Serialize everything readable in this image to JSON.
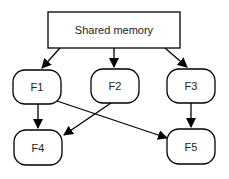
{
  "diagram": {
    "shared_memory": {
      "label": "Shared memory"
    },
    "nodes": [
      {
        "id": "F1",
        "label": "F1"
      },
      {
        "id": "F2",
        "label": "F2"
      },
      {
        "id": "F3",
        "label": "F3"
      },
      {
        "id": "F4",
        "label": "F4"
      },
      {
        "id": "F5",
        "label": "F5"
      }
    ],
    "edges": [
      {
        "from": "Shared memory",
        "to": "F1"
      },
      {
        "from": "Shared memory",
        "to": "F2"
      },
      {
        "from": "Shared memory",
        "to": "F3"
      },
      {
        "from": "F1",
        "to": "F4"
      },
      {
        "from": "F1",
        "to": "F5"
      },
      {
        "from": "F2",
        "to": "F4"
      },
      {
        "from": "F3",
        "to": "F5"
      }
    ],
    "colors": {
      "stroke": "#000000",
      "fill": "#ffffff",
      "text": "#222222"
    }
  }
}
